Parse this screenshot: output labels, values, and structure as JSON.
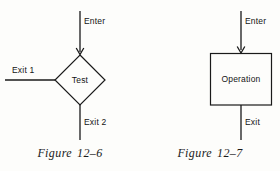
{
  "page": {
    "background_color": "#fdfdfb",
    "ink_color": "#1a1a1a"
  },
  "figures": [
    {
      "id": "figure-12-6",
      "caption_word": "Figure",
      "caption_number": "12–6",
      "shape": "diamond",
      "shape_label": "Test",
      "entry_label": "Enter",
      "exit_labels": [
        "Exit 1",
        "Exit 2"
      ],
      "ports": [
        {
          "name": "enter",
          "label": "Enter",
          "direction": "down",
          "arrow": true
        },
        {
          "name": "exit-1",
          "label": "Exit 1",
          "direction": "left",
          "arrow": false
        },
        {
          "name": "exit-2",
          "label": "Exit 2",
          "direction": "down",
          "arrow": false
        }
      ]
    },
    {
      "id": "figure-12-7",
      "caption_word": "Figure",
      "caption_number": "12–7",
      "shape": "rectangle",
      "shape_label": "Operation",
      "entry_label": "Enter",
      "exit_labels": [
        "Exit"
      ],
      "ports": [
        {
          "name": "enter",
          "label": "Enter",
          "direction": "down",
          "arrow": true
        },
        {
          "name": "exit",
          "label": "Exit",
          "direction": "down",
          "arrow": false
        }
      ]
    }
  ]
}
